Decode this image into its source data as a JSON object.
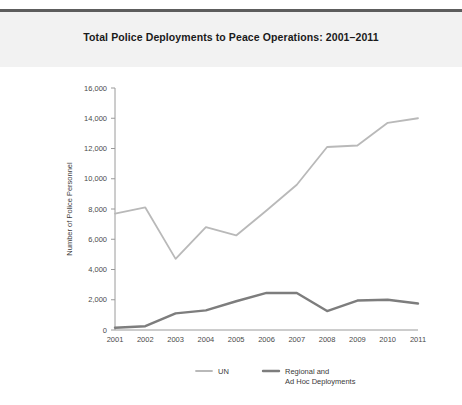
{
  "header": {
    "title": "Total Police Deployments to Peace Operations: 2001–2011"
  },
  "chart_data": {
    "type": "line",
    "title": "Total Police Deployments to Peace Operations: 2001–2011",
    "xlabel": "",
    "ylabel": "Number of Police Personnel",
    "categories": [
      "2001",
      "2002",
      "2003",
      "2004",
      "2005",
      "2006",
      "2007",
      "2008",
      "2009",
      "2010",
      "2011"
    ],
    "x": [
      2001,
      2002,
      2003,
      2004,
      2005,
      2006,
      2007,
      2008,
      2009,
      2010,
      2011
    ],
    "series": [
      {
        "name": "UN",
        "color": "#b9b9b9",
        "values": [
          7700,
          8100,
          4700,
          6800,
          6250,
          7900,
          9600,
          12100,
          12200,
          13700,
          14000
        ]
      },
      {
        "name": "Regional and\nAd Hoc Deployments",
        "color": "#7d7d7d",
        "values": [
          150,
          250,
          1100,
          1300,
          1900,
          2450,
          2450,
          1250,
          1950,
          2000,
          1750
        ]
      }
    ],
    "ylim": [
      0,
      16000
    ],
    "yticks": [
      0,
      2000,
      4000,
      6000,
      8000,
      10000,
      12000,
      14000,
      16000
    ],
    "ytick_labels": [
      "0",
      "2,000",
      "4,000",
      "6,000",
      "8,000",
      "10,000",
      "12,000",
      "14,000",
      "16,000"
    ],
    "grid": false,
    "legend_position": "bottom"
  },
  "legend": {
    "items": [
      {
        "label": "UN",
        "label2": "",
        "color": "#b9b9b9"
      },
      {
        "label": "Regional and",
        "label2": "Ad Hoc Deployments",
        "color": "#7d7d7d"
      }
    ]
  },
  "axes": {
    "y_title": "Number of Police Personnel",
    "y_labels": [
      "16,000",
      "14,000",
      "12,000",
      "10,000",
      "8,000",
      "6,000",
      "4,000",
      "2,000",
      "0"
    ],
    "x_labels": [
      "2001",
      "2002",
      "2003",
      "2004",
      "2005",
      "2006",
      "2007",
      "2008",
      "2009",
      "2010",
      "2011"
    ]
  }
}
